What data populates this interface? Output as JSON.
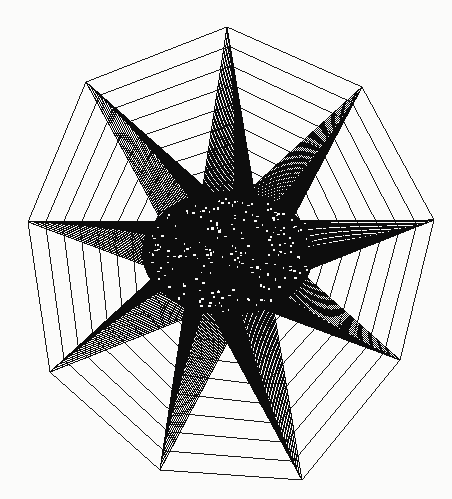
{
  "canvas": {
    "width": 452,
    "height": 499,
    "background_color": "#fbfbfa",
    "ink_color": "#0d0d0d",
    "title": "Nine-pointed star chord figure"
  },
  "figure": {
    "name": "star-polygon-line-art",
    "type": "chord-star-polygon",
    "point_count": 9,
    "center": {
      "x": 228,
      "y": 253
    },
    "outer_radius": 228,
    "inner_radius": 74,
    "rotation_deg": -90,
    "skew_deg": 4,
    "chord_step": 4,
    "ring_count": 34,
    "ring_scale_min": 0.06,
    "ring_scale_max": 1.0,
    "stroke_width": 1.05,
    "stroke_color": "#0d0d0d",
    "fill": "none",
    "spikes": [
      {
        "name": "spike-top",
        "angle_deg": 90,
        "tip_x": 227,
        "tip_y": 27
      },
      {
        "name": "spike-upper-right",
        "angle_deg": 49,
        "tip_x": 362,
        "tip_y": 87
      },
      {
        "name": "spike-right",
        "angle_deg": 8,
        "tip_x": 434,
        "tip_y": 220
      },
      {
        "name": "spike-lower-right",
        "angle_deg": -33,
        "tip_x": 400,
        "tip_y": 360
      },
      {
        "name": "spike-bottom-right",
        "angle_deg": -74,
        "tip_x": 302,
        "tip_y": 480
      },
      {
        "name": "spike-bottom-left",
        "angle_deg": -115,
        "tip_x": 160,
        "tip_y": 470
      },
      {
        "name": "spike-lower-left",
        "angle_deg": -156,
        "tip_x": 50,
        "tip_y": 372
      },
      {
        "name": "spike-left",
        "angle_deg": 172,
        "tip_x": 28,
        "tip_y": 222
      },
      {
        "name": "spike-upper-left",
        "angle_deg": 131,
        "tip_x": 86,
        "tip_y": 82
      }
    ],
    "core": {
      "name": "dense-core",
      "center_x": 228,
      "center_y": 253,
      "radius_x": 86,
      "radius_y": 62,
      "coverage": "solid-black-with-pinholes"
    }
  }
}
